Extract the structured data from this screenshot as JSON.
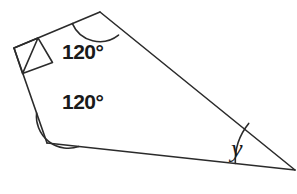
{
  "figure": {
    "kind": "geometry-diagram",
    "shape": "quadrilateral",
    "background_color": "#ffffff",
    "stroke_color": "#2b2b2b",
    "stroke_width": 1.6,
    "text_color": "#1a1a1a",
    "width": 297,
    "height": 194,
    "vertices": [
      {
        "name": "top-left",
        "x": 14,
        "y": 48
      },
      {
        "name": "top-apex",
        "x": 100,
        "y": 12
      },
      {
        "name": "right",
        "x": 295,
        "y": 170
      },
      {
        "name": "bottom-left",
        "x": 47,
        "y": 143
      }
    ],
    "edges": [
      {
        "name": "edge-top-left-to-apex",
        "from": "top-left",
        "to": "top-apex"
      },
      {
        "name": "edge-apex-to-right",
        "from": "top-apex",
        "to": "right"
      },
      {
        "name": "edge-right-to-bottom",
        "from": "right",
        "to": "bottom-left"
      },
      {
        "name": "edge-bottom-to-top-left",
        "from": "bottom-left",
        "to": "top-left"
      }
    ],
    "angle_markers": [
      {
        "name": "right-angle-square",
        "at_vertex": "top-left",
        "marker_type": "square",
        "measure": "90",
        "label": ""
      },
      {
        "name": "angle-arc-top",
        "at_vertex": "top-apex",
        "marker_type": "arc",
        "measure": "120",
        "label": "120°"
      },
      {
        "name": "angle-arc-bottom-left",
        "at_vertex": "bottom-left",
        "marker_type": "arc",
        "measure": "120",
        "label": "120°"
      },
      {
        "name": "angle-arc-right",
        "at_vertex": "right",
        "marker_type": "arc",
        "measure": "y",
        "label": "y"
      }
    ],
    "labels": {
      "angle_top": "120°",
      "angle_bottom_left": "120°",
      "angle_right_variable": "y"
    }
  }
}
